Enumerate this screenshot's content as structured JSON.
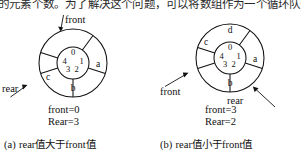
{
  "header": {
    "cut_text": "的元素个数。为了解决这个问题，可以将数组作为一个循环队列来使用，即当 long"
  },
  "figures": [
    {
      "id": "figure-a",
      "caption": "(a) rear值大于front值",
      "caption_prefix": "(a)",
      "caption_latin1": "rear",
      "caption_cn1": "值大于",
      "caption_latin2": "front",
      "caption_cn2": "值",
      "front_label": "front",
      "rear_label": "rear",
      "front_value_text": "front=0",
      "rear_value_text": "Rear=3",
      "front_index": 0,
      "rear_index": 3,
      "inner_indices": [
        "0",
        "1",
        "2",
        "3",
        "4"
      ],
      "sectors": [
        {
          "slot": 0,
          "label": ""
        },
        {
          "slot": 1,
          "label": "a"
        },
        {
          "slot": 2,
          "label": "b"
        },
        {
          "slot": 3,
          "label": "c"
        },
        {
          "slot": 4,
          "label": ""
        }
      ]
    },
    {
      "id": "figure-b",
      "caption": "(b) rear值小于front值",
      "caption_prefix": "(b)",
      "caption_latin1": "rear",
      "caption_cn1": "值小于",
      "caption_latin2": "front",
      "caption_cn2": "值",
      "front_label": "front",
      "rear_label": "rear",
      "front_value_text": "front=3",
      "rear_value_text": "Rear=2",
      "front_index": 3,
      "rear_index": 2,
      "inner_indices": [
        "0",
        "1",
        "2",
        "3",
        "4"
      ],
      "sectors": [
        {
          "slot": 0,
          "label": "d"
        },
        {
          "slot": 1,
          "label": "a"
        },
        {
          "slot": 2,
          "label": "b"
        },
        {
          "slot": 3,
          "label": "c"
        },
        {
          "slot": 4,
          "label": ""
        }
      ]
    }
  ],
  "colors": {
    "ink": "#111111",
    "paper": "#ffffff"
  }
}
